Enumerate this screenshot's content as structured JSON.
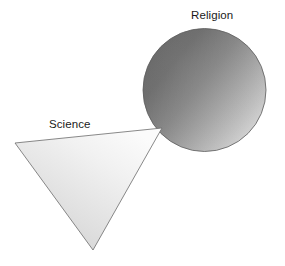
{
  "diagram": {
    "background_color": "#ffffff",
    "labels": {
      "religion": "Religion",
      "science": "Science"
    },
    "label_color": "#1a1a1a",
    "shapes": [
      {
        "name": "religion-sphere",
        "type": "circle",
        "label": "Religion",
        "center_x": 204.5,
        "center_y": 90,
        "radius": 61.5,
        "outline_color": "#5a5a5a",
        "outline_width": 0.8,
        "gradient": {
          "type": "linear-diagonal",
          "from_color": "#6a6a6a",
          "mid_color": "#9a9a9a",
          "to_color": "#dcdcdc",
          "direction": "upper-left-dark to lower-right-light"
        }
      },
      {
        "name": "science-triangle",
        "type": "triangle",
        "label": "Science",
        "vertices": [
          {
            "x": 15,
            "y": 143
          },
          {
            "x": 162,
            "y": 128
          },
          {
            "x": 93,
            "y": 250
          }
        ],
        "outline_color": "#6b6b6b",
        "outline_width": 0.8,
        "gradient": {
          "type": "linear-diagonal",
          "from_color": "#d5d5d5",
          "to_color": "#fafafa",
          "direction": "bottom-left-darker to top-right-lighter"
        }
      }
    ],
    "relation": "The Science triangle apex touches the lower-left edge of the Religion sphere"
  }
}
